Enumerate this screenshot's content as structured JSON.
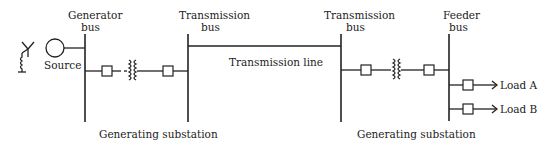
{
  "diagram": {
    "type": "single-line power system diagram",
    "labels": {
      "generator_bus_1": "Generator",
      "generator_bus_2": "bus",
      "source": "Source",
      "transmission_bus_left_1": "Transmission",
      "transmission_bus_left_2": "bus",
      "transmission_line": "Transmission line",
      "transmission_bus_right_1": "Transmission",
      "transmission_bus_right_2": "bus",
      "feeder_bus_1": "Feeder",
      "feeder_bus_2": "bus",
      "load_a": "Load A",
      "load_b": "Load B",
      "substation_left": "Generating substation",
      "substation_right": "Generating substation"
    },
    "icons": {
      "grounded_wye": "grounded-wye-icon",
      "generator": "generator-circle-icon",
      "breaker": "circuit-breaker-square-icon",
      "transformer": "transformer-coil-icon",
      "load_arrow": "arrow-right-icon"
    },
    "colors": {
      "line": "#222222",
      "background": "#ffffff"
    }
  }
}
